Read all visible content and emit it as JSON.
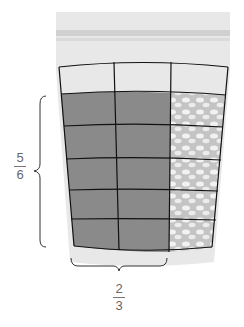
{
  "diagram": {
    "grid": {
      "columns": 3,
      "rows": 6,
      "shaded_columns": 2,
      "shaded_rows": 5
    },
    "colors": {
      "bag": "#e6e6e6",
      "bag_seal": "#d2d2d2",
      "shaded": "#8a8a8a",
      "unshaded_candy": "#c8c8c8",
      "grid_line": "#111111",
      "label": "#666666"
    },
    "labels": {
      "vertical": {
        "numerator": "5",
        "denominator": "6"
      },
      "horizontal": {
        "numerator": "2",
        "denominator": "3"
      }
    }
  }
}
